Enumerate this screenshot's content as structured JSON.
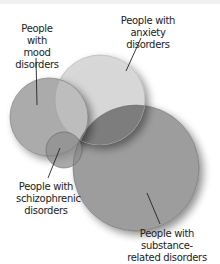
{
  "diagram": {
    "type": "venn",
    "sets": [
      {
        "id": "mood",
        "label": "People with mood disorders",
        "lines": [
          "People with",
          "mood",
          "disorders"
        ],
        "color": "#a9a9a9"
      },
      {
        "id": "anxiety",
        "label": "People with anxiety disorders",
        "lines": [
          "People with",
          "anxiety disorders"
        ],
        "color": "#d4d4d4"
      },
      {
        "id": "substance",
        "label": "People with substance-related disorders",
        "lines": [
          "People with substance-",
          "related disorders"
        ],
        "color": "#9a9a9a"
      },
      {
        "id": "schizophrenic",
        "label": "People with schizophrenic disorders",
        "lines": [
          "People with",
          "schizophrenic",
          "disorders"
        ],
        "color": "#8e8e8e"
      }
    ],
    "center_overlap_color": "#111111"
  }
}
